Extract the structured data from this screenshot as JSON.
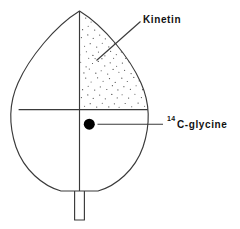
{
  "figure": {
    "background_color": "#ffffff",
    "line_color": "#3a3a3a",
    "ink_color": "#111111"
  },
  "labels": {
    "kinetin": {
      "text": "Kinetin",
      "name": "kinetin-label"
    },
    "glycine": {
      "superscript": "14",
      "text": "C-glycine",
      "name": "c14-glycine-label"
    }
  },
  "regions": {
    "stippled_quadrant": {
      "name": "kinetin-treated-region",
      "description": "upper right quadrant stippled",
      "fill_pattern": "stipple",
      "dot_color": "#555555"
    },
    "application_dot": {
      "name": "glycine-application-point",
      "color": "#000000",
      "radius": 5.5
    }
  },
  "leaf_parts": {
    "outline": "leaf-outline",
    "midrib": "leaf-midrib",
    "transverse_line": "leaf-transverse-line",
    "petiole": "leaf-petiole"
  }
}
